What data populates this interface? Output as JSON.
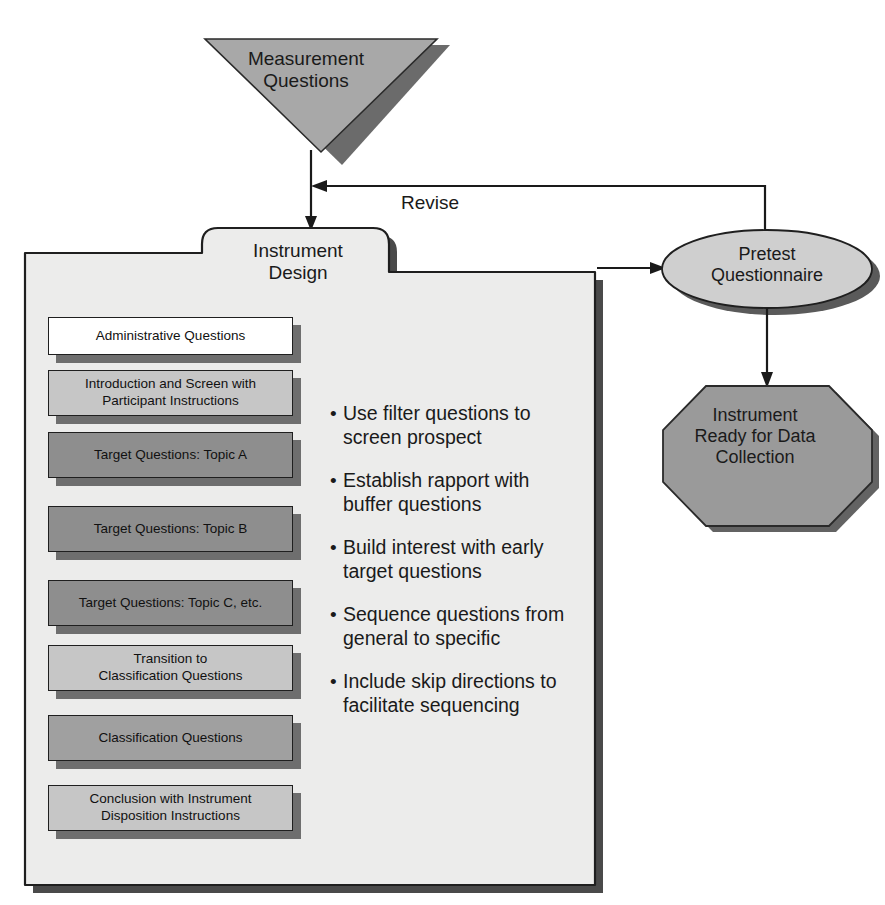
{
  "diagram": {
    "background_color": "#ffffff"
  },
  "nodes": {
    "measurement_questions": {
      "label": "Measurement\nQuestions",
      "shape": "inverted-triangle",
      "fill": "#a8a8a8",
      "shadow": "#6b6b6b"
    },
    "instrument_design": {
      "label": "Instrument\nDesign",
      "shape": "folder",
      "fill": "#ececeb",
      "shadow": "#4a4a4a"
    },
    "pretest_questionnaire": {
      "label": "Pretest\nQuestionnaire",
      "shape": "ellipse",
      "fill": "#cfcfcf",
      "shadow": "#5a5a5a"
    },
    "instrument_ready": {
      "label": "Instrument\nReady for Data\nCollection",
      "shape": "octagon",
      "fill": "#9a9a9a",
      "shadow": "#636363"
    }
  },
  "connectors": {
    "revise_label": "Revise",
    "measurement_to_design": "arrow-down",
    "design_to_pretest": "arrow-right",
    "pretest_to_ready": "arrow-down",
    "pretest_to_design_revise": "arrow-left"
  },
  "question_boxes": [
    {
      "label": "Administrative Questions",
      "fill": "#ffffff",
      "top": 317,
      "height": 38
    },
    {
      "label": "Introduction and Screen with\nParticipant Instructions",
      "fill": "#c6c6c6",
      "top": 370,
      "height": 46
    },
    {
      "label": "Target Questions: Topic A",
      "fill": "#8e8e8e",
      "top": 432,
      "height": 46
    },
    {
      "label": "Target Questions: Topic B",
      "fill": "#8e8e8e",
      "top": 506,
      "height": 46
    },
    {
      "label": "Target Questions: Topic C, etc.",
      "fill": "#8e8e8e",
      "top": 580,
      "height": 46
    },
    {
      "label": "Transition to\nClassification Questions",
      "fill": "#c6c6c6",
      "top": 645,
      "height": 46
    },
    {
      "label": "Classification Questions",
      "fill": "#a0a0a0",
      "top": 715,
      "height": 46
    },
    {
      "label": "Conclusion with Instrument\nDisposition Instructions",
      "fill": "#c6c6c6",
      "top": 785,
      "height": 46
    }
  ],
  "bullets": [
    "Use filter questions to\nscreen prospect",
    "Establish rapport with\nbuffer questions",
    "Build interest with early\ntarget questions",
    "Sequence questions from\ngeneral to specific",
    "Include skip directions to\nfacilitate sequencing"
  ],
  "bullet_marker": "•",
  "colors": {
    "line": "#1a1a1a",
    "text": "#1a1a1a",
    "folder_fill": "#ececeb",
    "folder_shadow": "#4a4a4a"
  }
}
